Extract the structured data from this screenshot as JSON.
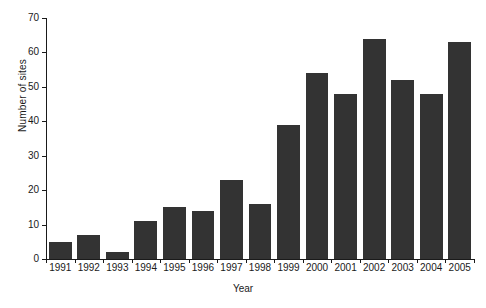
{
  "chart_data": {
    "type": "bar",
    "title": "",
    "xlabel": "Year",
    "ylabel": "Number of sites",
    "categories": [
      "1991",
      "1992",
      "1993",
      "1994",
      "1995",
      "1996",
      "1997",
      "1998",
      "1999",
      "2000",
      "2001",
      "2002",
      "2003",
      "2004",
      "2005"
    ],
    "values": [
      5,
      7,
      2,
      11,
      15,
      14,
      23,
      16,
      39,
      54,
      48,
      64,
      52,
      48,
      63
    ],
    "series": [
      {
        "name": "Number of sites",
        "values": [
          5,
          7,
          2,
          11,
          15,
          14,
          23,
          16,
          39,
          54,
          48,
          64,
          52,
          48,
          63
        ]
      }
    ],
    "ylim": [
      0,
      70
    ],
    "ytick_labels": [
      "0",
      "10",
      "20",
      "30",
      "40",
      "50",
      "60",
      "70"
    ],
    "ytick_values": [
      0,
      10,
      20,
      30,
      40,
      50,
      60,
      70
    ],
    "grid": false,
    "legend": false,
    "legend_position": "none",
    "bar_color": "#333333",
    "axis_color": "#1a1a1a",
    "background": "#ffffff"
  }
}
